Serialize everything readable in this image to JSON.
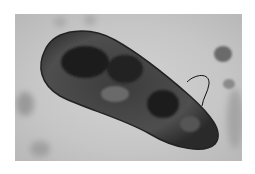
{
  "image": {
    "subject": "paramecium micrograph",
    "colors": {
      "background": "#ffffff",
      "field": "#c8c8c8",
      "cell_body": "#4a4a4a",
      "cell_dark": "#1e1e1e",
      "debris": "#8a8a8a"
    }
  }
}
